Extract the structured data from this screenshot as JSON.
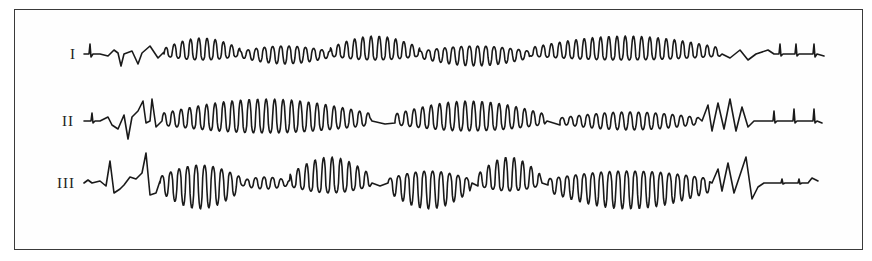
{
  "figure": {
    "type": "ecg-rhythm-strip",
    "leads": [
      {
        "label": "I",
        "baseline_y": 54,
        "label_x": 70,
        "label_y": 47
      },
      {
        "label": "II",
        "baseline_y": 121,
        "label_x": 62,
        "label_y": 115
      },
      {
        "label": "III",
        "baseline_y": 183,
        "label_x": 57,
        "label_y": 176
      }
    ],
    "colors": {
      "trace": "#1a1a1a",
      "border": "#3a3a3a",
      "background": "#ffffff"
    }
  }
}
